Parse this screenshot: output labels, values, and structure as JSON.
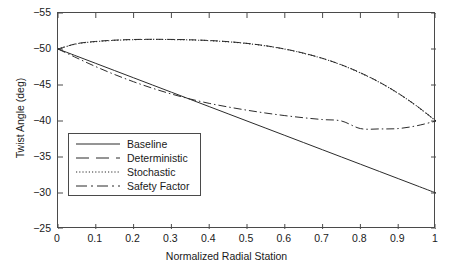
{
  "chart_data": {
    "type": "line",
    "title": "",
    "xlabel": "Normalized Radial Station",
    "ylabel": "Twist Angle (deg)",
    "xlim": [
      0,
      1
    ],
    "ylim": [
      -25,
      -55
    ],
    "y_axis_inverted": true,
    "grid": false,
    "legend_position": "center-left-inside",
    "xticks": [
      "0",
      "0.1",
      "0.2",
      "0.3",
      "0.4",
      "0.5",
      "0.6",
      "0.7",
      "0.8",
      "0.9",
      "1"
    ],
    "xtick_values": [
      0,
      0.1,
      0.2,
      0.3,
      0.4,
      0.5,
      0.6,
      0.7,
      0.8,
      0.9,
      1
    ],
    "yticks": [
      "−55",
      "−50",
      "−45",
      "−40",
      "−35",
      "−30",
      "−25"
    ],
    "ytick_values": [
      -55,
      -50,
      -45,
      -40,
      -35,
      -30,
      -25
    ],
    "x": [
      0,
      0.05,
      0.1,
      0.15,
      0.2,
      0.25,
      0.3,
      0.35,
      0.4,
      0.45,
      0.5,
      0.55,
      0.6,
      0.65,
      0.7,
      0.75,
      0.8,
      0.85,
      0.9,
      0.95,
      1
    ],
    "series": [
      {
        "name": "Baseline",
        "style": "solid",
        "color": "#2b2b2b",
        "values": [
          -50,
          -49,
          -48,
          -47,
          -46,
          -45,
          -44,
          -43,
          -42,
          -41,
          -40,
          -39,
          -38,
          -37,
          -36,
          -35,
          -34,
          -33,
          -32,
          -31,
          -30
        ]
      },
      {
        "name": "Deterministic",
        "style": "dashed",
        "color": "#2b2b2b",
        "values": [
          -50.0,
          -50.75,
          -51.05,
          -51.23,
          -51.32,
          -51.35,
          -51.33,
          -51.28,
          -51.18,
          -51.02,
          -50.78,
          -50.45,
          -50.0,
          -49.42,
          -48.7,
          -47.8,
          -46.7,
          -45.4,
          -43.85,
          -42.05,
          -40.0
        ]
      },
      {
        "name": "Stochastic",
        "style": "dotted",
        "color": "#2b2b2b",
        "values": [
          -50.0,
          -50.72,
          -51.02,
          -51.2,
          -51.3,
          -51.33,
          -51.31,
          -51.26,
          -51.16,
          -51.0,
          -50.76,
          -50.43,
          -49.98,
          -49.4,
          -48.68,
          -47.78,
          -46.68,
          -45.38,
          -43.83,
          -42.03,
          -40.0
        ]
      },
      {
        "name": "Safety Factor",
        "style": "dashdot",
        "color": "#2b2b2b",
        "values": [
          -50.0,
          -48.75,
          -47.55,
          -46.45,
          -45.45,
          -44.55,
          -43.75,
          -43.05,
          -42.45,
          -41.95,
          -41.5,
          -41.1,
          -40.75,
          -40.45,
          -40.2,
          -40.0,
          -38.95,
          -38.9,
          -38.95,
          -39.35,
          -40.0
        ]
      }
    ]
  },
  "axes": {
    "xlabel": "Normalized Radial Station",
    "ylabel": "Twist Angle (deg)"
  },
  "legend": {
    "items": [
      {
        "label": "Baseline"
      },
      {
        "label": "Deterministic"
      },
      {
        "label": "Stochastic"
      },
      {
        "label": "Safety Factor"
      }
    ]
  }
}
